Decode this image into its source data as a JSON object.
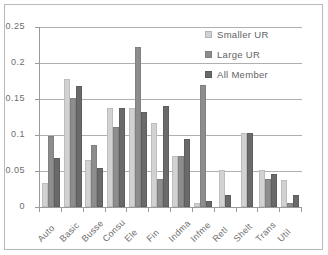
{
  "chart_data": {
    "type": "bar",
    "title": "",
    "xlabel": "",
    "ylabel": "",
    "ylim": [
      0,
      0.25
    ],
    "yticks": [
      "0",
      "0.05",
      "0.1",
      "0.15",
      "0.2",
      "0.25"
    ],
    "ytick_values": [
      0,
      0.05,
      0.1,
      0.15,
      0.2,
      0.25
    ],
    "grid": true,
    "legend_position": "top-right",
    "categories": [
      "Auto",
      "Basic",
      "Busse",
      "Consu",
      "Ele",
      "Fin",
      "Indma",
      "Infme",
      "Retl",
      "Shelt",
      "Trans",
      "Util"
    ],
    "series": [
      {
        "name": "Smaller UR",
        "color": "#d2d2d2",
        "values": [
          0.033,
          0.178,
          0.065,
          0.137,
          0.137,
          0.116,
          0.071,
          0.005,
          0.051,
          0.103,
          0.051,
          0.038
        ]
      },
      {
        "name": "Large UR",
        "color": "#8d8d8d",
        "values": [
          0.099,
          0.151,
          0.086,
          0.111,
          0.222,
          0.039,
          0.071,
          0.169,
          0.0,
          0.0,
          0.039,
          0.005
        ]
      },
      {
        "name": "All Member",
        "color": "#6a6a6a",
        "values": [
          0.068,
          0.168,
          0.054,
          0.137,
          0.132,
          0.14,
          0.095,
          0.009,
          0.016,
          0.103,
          0.046,
          0.017
        ]
      }
    ]
  }
}
